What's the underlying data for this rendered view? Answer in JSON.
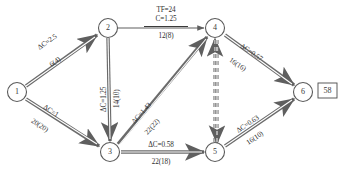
{
  "diagram": {
    "nodes": [
      {
        "id": "n1",
        "label": "1",
        "cx": 17,
        "cy": 92
      },
      {
        "id": "n2",
        "label": "2",
        "cx": 108,
        "cy": 28
      },
      {
        "id": "n3",
        "label": "3",
        "cx": 110,
        "cy": 152
      },
      {
        "id": "n4",
        "label": "4",
        "cx": 215,
        "cy": 28
      },
      {
        "id": "n5",
        "label": "5",
        "cx": 215,
        "cy": 152
      },
      {
        "id": "n6",
        "label": "6",
        "cx": 303,
        "cy": 92
      }
    ],
    "result_box": {
      "name": "total-cost-box",
      "value": "58"
    },
    "edges": [
      {
        "id": "e12",
        "from": "1",
        "to": "2",
        "style": "double-solid",
        "label_top": "ΔC=2.5",
        "label_bottom": "6(4)",
        "rotation": -35
      },
      {
        "id": "e13",
        "from": "1",
        "to": "3",
        "style": "double-solid",
        "label_top": "ΔC=1",
        "label_bottom": "20(20)",
        "rotation": 33
      },
      {
        "id": "e23",
        "from": "2",
        "to": "3",
        "style": "double-solid",
        "label_left": "ΔC=1.25",
        "label_right": "14(10)",
        "rotation": -90
      },
      {
        "id": "e24",
        "from": "2",
        "to": "4",
        "style": "single-solid",
        "label_line1": "TF=24",
        "label_line2": "C=1.25",
        "label_line3": "12(8)",
        "rotation": 0
      },
      {
        "id": "e34",
        "from": "3",
        "to": "4",
        "style": "double-solid",
        "label_top": "ΔC=1.43",
        "label_bottom": "22(22)",
        "rotation": -48
      },
      {
        "id": "e35",
        "from": "3",
        "to": "5",
        "style": "double-solid",
        "label_top": "ΔC=0.58",
        "label_bottom": "22(18)",
        "rotation": 0
      },
      {
        "id": "e46",
        "from": "4",
        "to": "6",
        "style": "double-solid",
        "label_top": "ΔC=0.57",
        "label_bottom": "16(16)",
        "rotation": 34
      },
      {
        "id": "e56",
        "from": "5",
        "to": "6",
        "style": "double-solid",
        "label_top": "ΔC=0.63",
        "label_bottom": "16(10)",
        "rotation": -34
      },
      {
        "id": "e54",
        "from": "5",
        "to": "4",
        "style": "dashed-bidirectional",
        "label_top": "",
        "label_bottom": ""
      }
    ]
  }
}
